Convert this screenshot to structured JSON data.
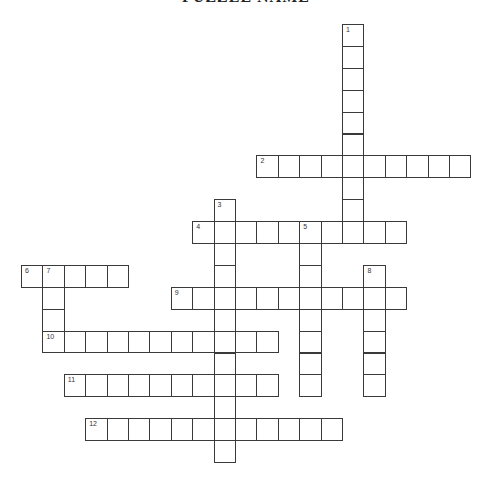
{
  "puzzle": {
    "title": "PUZZLE NAME",
    "cell_color": "#ffffff",
    "border_color": "#3a3a3a",
    "words": [
      {
        "number": "1",
        "direction": "down",
        "row": 0,
        "col": 15,
        "length": 10
      },
      {
        "number": "2",
        "direction": "across",
        "row": 6,
        "col": 11,
        "length": 10
      },
      {
        "number": "3",
        "direction": "down",
        "row": 8,
        "col": 9,
        "length": 12
      },
      {
        "number": "4",
        "direction": "across",
        "row": 9,
        "col": 8,
        "length": 10
      },
      {
        "number": "5",
        "direction": "down",
        "row": 9,
        "col": 13,
        "length": 8
      },
      {
        "number": "6",
        "direction": "across",
        "row": 11,
        "col": 0,
        "length": 5
      },
      {
        "number": "7",
        "direction": "down",
        "row": 11,
        "col": 1,
        "length": 4
      },
      {
        "number": "8",
        "direction": "down",
        "row": 11,
        "col": 16,
        "length": 6
      },
      {
        "number": "9",
        "direction": "across",
        "row": 12,
        "col": 7,
        "length": 11
      },
      {
        "number": "10",
        "direction": "across",
        "row": 14,
        "col": 1,
        "length": 11
      },
      {
        "number": "11",
        "direction": "across",
        "row": 16,
        "col": 2,
        "length": 10
      },
      {
        "number": "12",
        "direction": "across",
        "row": 18,
        "col": 3,
        "length": 12
      }
    ]
  }
}
